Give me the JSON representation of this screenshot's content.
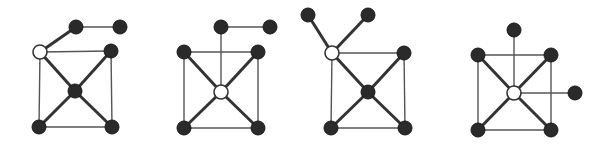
{
  "diagram": {
    "title": "",
    "colors": {
      "black_node": "#2a2a2a",
      "white_node": "#ffffff",
      "edge": "#444444"
    },
    "graphs": [
      {
        "id": "graph-1",
        "nodes": [
          {
            "id": "w",
            "x": 40,
            "y": 52,
            "color": "white"
          },
          {
            "id": "t1",
            "x": 76,
            "y": 27,
            "color": "black"
          },
          {
            "id": "t2",
            "x": 120,
            "y": 27,
            "color": "black"
          },
          {
            "id": "rt",
            "x": 111,
            "y": 51,
            "color": "black"
          },
          {
            "id": "c",
            "x": 75,
            "y": 91,
            "color": "black"
          },
          {
            "id": "bl",
            "x": 39,
            "y": 127,
            "color": "black"
          },
          {
            "id": "br",
            "x": 112,
            "y": 127,
            "color": "black"
          }
        ],
        "edges": [
          {
            "from": "w",
            "to": "t1",
            "weight": "thick"
          },
          {
            "from": "t1",
            "to": "t2",
            "weight": "thin"
          },
          {
            "from": "w",
            "to": "rt",
            "weight": "thin"
          },
          {
            "from": "w",
            "to": "bl",
            "weight": "thin"
          },
          {
            "from": "w",
            "to": "c",
            "weight": "thick"
          },
          {
            "from": "rt",
            "to": "c",
            "weight": "thick"
          },
          {
            "from": "rt",
            "to": "br",
            "weight": "thin"
          },
          {
            "from": "c",
            "to": "bl",
            "weight": "thick"
          },
          {
            "from": "c",
            "to": "br",
            "weight": "thick"
          },
          {
            "from": "bl",
            "to": "br",
            "weight": "thin"
          }
        ]
      },
      {
        "id": "graph-2",
        "nodes": [
          {
            "id": "t1",
            "x": 221,
            "y": 27,
            "color": "black"
          },
          {
            "id": "t2",
            "x": 270,
            "y": 27,
            "color": "black"
          },
          {
            "id": "lt",
            "x": 184,
            "y": 52,
            "color": "black"
          },
          {
            "id": "rt",
            "x": 258,
            "y": 52,
            "color": "black"
          },
          {
            "id": "w",
            "x": 221,
            "y": 92,
            "color": "white"
          },
          {
            "id": "bl",
            "x": 184,
            "y": 128,
            "color": "black"
          },
          {
            "id": "br",
            "x": 258,
            "y": 128,
            "color": "black"
          }
        ],
        "edges": [
          {
            "from": "t1",
            "to": "t2",
            "weight": "thin"
          },
          {
            "from": "t1",
            "to": "w",
            "weight": "thin"
          },
          {
            "from": "lt",
            "to": "rt",
            "weight": "thin"
          },
          {
            "from": "lt",
            "to": "bl",
            "weight": "thin"
          },
          {
            "from": "rt",
            "to": "br",
            "weight": "thin"
          },
          {
            "from": "bl",
            "to": "br",
            "weight": "thin"
          },
          {
            "from": "lt",
            "to": "w",
            "weight": "thick"
          },
          {
            "from": "rt",
            "to": "w",
            "weight": "thick"
          },
          {
            "from": "bl",
            "to": "w",
            "weight": "thick"
          },
          {
            "from": "br",
            "to": "w",
            "weight": "thick"
          }
        ]
      },
      {
        "id": "graph-3",
        "nodes": [
          {
            "id": "tl",
            "x": 308,
            "y": 15,
            "color": "black"
          },
          {
            "id": "tr",
            "x": 368,
            "y": 15,
            "color": "black"
          },
          {
            "id": "w",
            "x": 332,
            "y": 53,
            "color": "white"
          },
          {
            "id": "rt",
            "x": 404,
            "y": 53,
            "color": "black"
          },
          {
            "id": "c",
            "x": 368,
            "y": 92,
            "color": "black"
          },
          {
            "id": "bl",
            "x": 331,
            "y": 128,
            "color": "black"
          },
          {
            "id": "br",
            "x": 405,
            "y": 128,
            "color": "black"
          }
        ],
        "edges": [
          {
            "from": "tl",
            "to": "w",
            "weight": "thick"
          },
          {
            "from": "tr",
            "to": "w",
            "weight": "thick"
          },
          {
            "from": "w",
            "to": "rt",
            "weight": "thin"
          },
          {
            "from": "w",
            "to": "bl",
            "weight": "thin"
          },
          {
            "from": "w",
            "to": "c",
            "weight": "thick"
          },
          {
            "from": "rt",
            "to": "c",
            "weight": "thick"
          },
          {
            "from": "rt",
            "to": "br",
            "weight": "thin"
          },
          {
            "from": "c",
            "to": "bl",
            "weight": "thick"
          },
          {
            "from": "c",
            "to": "br",
            "weight": "thick"
          },
          {
            "from": "bl",
            "to": "br",
            "weight": "thin"
          }
        ]
      },
      {
        "id": "graph-4",
        "nodes": [
          {
            "id": "t",
            "x": 514,
            "y": 30,
            "color": "black"
          },
          {
            "id": "lt",
            "x": 478,
            "y": 55,
            "color": "black"
          },
          {
            "id": "rt",
            "x": 551,
            "y": 55,
            "color": "black"
          },
          {
            "id": "w",
            "x": 514,
            "y": 93,
            "color": "white"
          },
          {
            "id": "r",
            "x": 575,
            "y": 93,
            "color": "black"
          },
          {
            "id": "bl",
            "x": 478,
            "y": 130,
            "color": "black"
          },
          {
            "id": "br",
            "x": 551,
            "y": 130,
            "color": "black"
          }
        ],
        "edges": [
          {
            "from": "t",
            "to": "w",
            "weight": "thin"
          },
          {
            "from": "w",
            "to": "r",
            "weight": "thin"
          },
          {
            "from": "lt",
            "to": "rt",
            "weight": "thin"
          },
          {
            "from": "lt",
            "to": "bl",
            "weight": "thin"
          },
          {
            "from": "rt",
            "to": "br",
            "weight": "thin"
          },
          {
            "from": "bl",
            "to": "br",
            "weight": "thin"
          },
          {
            "from": "lt",
            "to": "w",
            "weight": "thick"
          },
          {
            "from": "rt",
            "to": "w",
            "weight": "thick"
          },
          {
            "from": "bl",
            "to": "w",
            "weight": "thick"
          },
          {
            "from": "br",
            "to": "w",
            "weight": "thick"
          }
        ]
      }
    ]
  }
}
